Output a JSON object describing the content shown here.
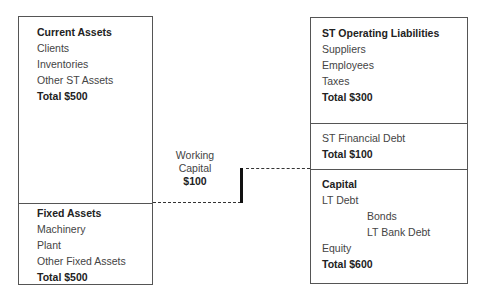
{
  "assets": {
    "current": {
      "title": "Current Assets",
      "items": [
        "Clients",
        "Inventories",
        "Other ST Assets"
      ],
      "total": "Total $500"
    },
    "fixed": {
      "title": "Fixed Assets",
      "items": [
        "Machinery",
        "Plant",
        "Other Fixed Assets"
      ],
      "total": "Total $500"
    }
  },
  "liabilities": {
    "st_operating": {
      "title": "ST Operating Liabilities",
      "items": [
        "Suppliers",
        "Employees",
        "Taxes"
      ],
      "total": "Total $300"
    },
    "st_financial": {
      "title": "ST Financial Debt",
      "total": "Total $100"
    },
    "capital": {
      "title": "Capital",
      "lt_debt": "LT Debt",
      "lt_debt_items": [
        "Bonds",
        "LT Bank Debt"
      ],
      "equity": "Equity",
      "total": "Total $600"
    }
  },
  "working_capital": {
    "line1": "Working",
    "line2": "Capital",
    "value": "$100"
  }
}
